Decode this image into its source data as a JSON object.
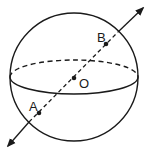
{
  "diagram": {
    "type": "sphere-with-diameter",
    "points": [
      {
        "id": "B",
        "label": "B"
      },
      {
        "id": "O",
        "label": "O"
      },
      {
        "id": "A",
        "label": "A"
      }
    ],
    "colors": {
      "stroke": "#1a1a1a",
      "background": "#ffffff"
    }
  }
}
